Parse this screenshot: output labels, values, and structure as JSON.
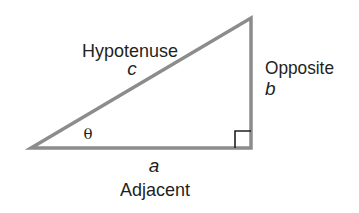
{
  "figure": {
    "type": "right-triangle",
    "colors": {
      "background": "#ffffff",
      "stroke": "#8c8c8c",
      "right_angle_marker": "#231f20",
      "text": "#231f20"
    },
    "vertices": {
      "bottom_left": [
        31,
        148
      ],
      "bottom_right": [
        251,
        148
      ],
      "top_right": [
        251,
        18
      ]
    },
    "angle_label": "θ",
    "sides": {
      "hypotenuse": {
        "name": "Hypotenuse",
        "variable": "c"
      },
      "opposite": {
        "name": "Opposite",
        "variable": "b"
      },
      "adjacent": {
        "name": "Adjacent",
        "variable": "a"
      }
    },
    "right_angle_marker": true
  }
}
